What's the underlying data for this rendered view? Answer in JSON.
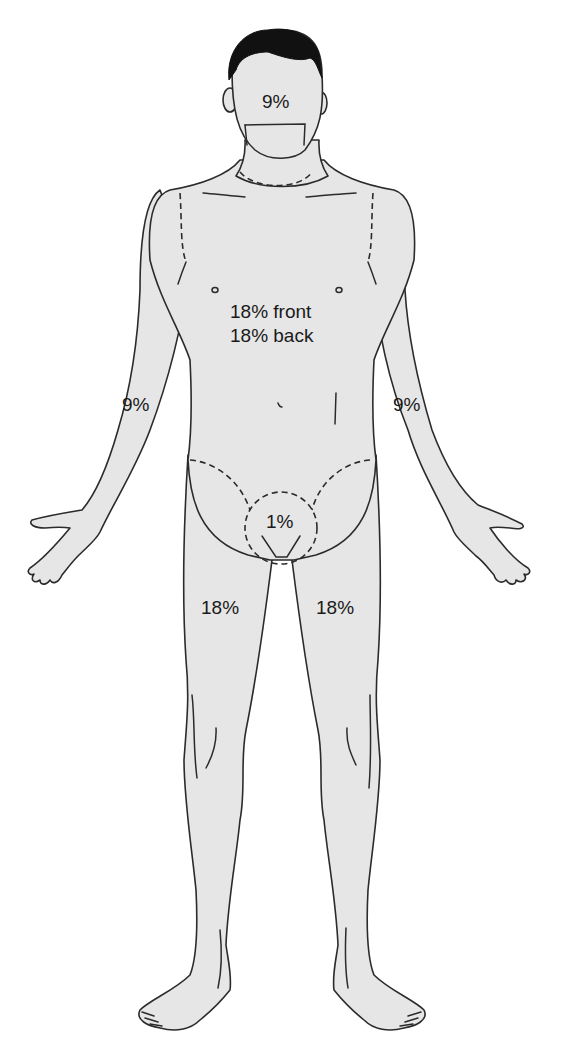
{
  "diagram": {
    "type": "rule-of-nines",
    "colors": {
      "skin": "#e6e6e6",
      "outline": "#2b2b2b",
      "hair": "#111111",
      "background": "#ffffff"
    },
    "regions": {
      "head": {
        "label": "9%"
      },
      "trunk": {
        "front_label": "18% front",
        "back_label": "18% back"
      },
      "left_arm": {
        "label": "9%"
      },
      "right_arm": {
        "label": "9%"
      },
      "perineum": {
        "label": "1%"
      },
      "left_leg": {
        "label": "18%"
      },
      "right_leg": {
        "label": "18%"
      }
    }
  }
}
